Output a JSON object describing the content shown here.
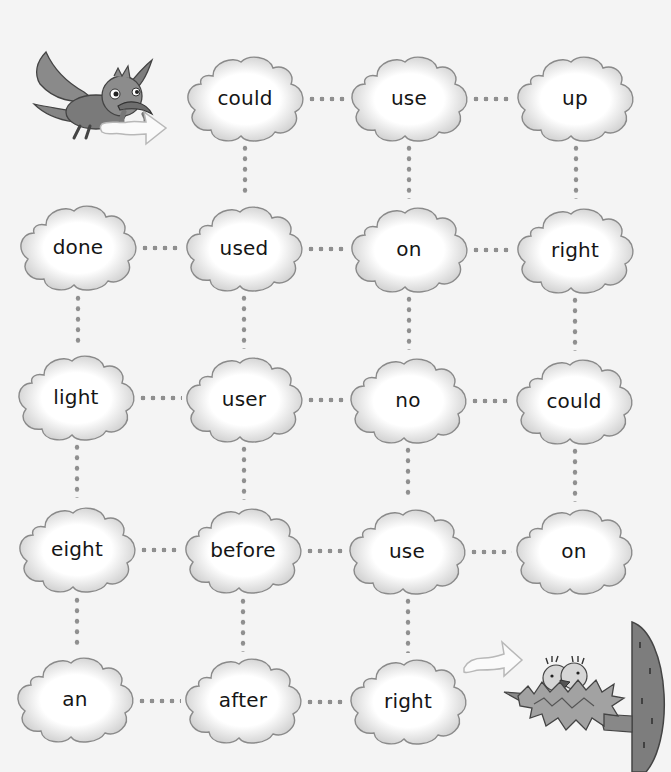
{
  "puzzle": {
    "type": "word-maze",
    "start_label": "bird-with-worm",
    "end_label": "nest-with-chicks",
    "grid": [
      [
        "",
        "could",
        "use",
        "up"
      ],
      [
        "done",
        "used",
        "on",
        "right"
      ],
      [
        "light",
        "user",
        "no",
        "could"
      ],
      [
        "eight",
        "before",
        "use",
        "on"
      ],
      [
        "an",
        "after",
        "right",
        ""
      ]
    ],
    "clouds": [
      {
        "id": "r0c1",
        "word": "could",
        "x": 245,
        "y": 98
      },
      {
        "id": "r0c2",
        "word": "use",
        "x": 409,
        "y": 98
      },
      {
        "id": "r0c3",
        "word": "up",
        "x": 575,
        "y": 98
      },
      {
        "id": "r1c0",
        "word": "done",
        "x": 78,
        "y": 247
      },
      {
        "id": "r1c1",
        "word": "used",
        "x": 244,
        "y": 248
      },
      {
        "id": "r1c2",
        "word": "on",
        "x": 409,
        "y": 249
      },
      {
        "id": "r1c3",
        "word": "right",
        "x": 575,
        "y": 250
      },
      {
        "id": "r2c0",
        "word": "light",
        "x": 76,
        "y": 397
      },
      {
        "id": "r2c1",
        "word": "user",
        "x": 244,
        "y": 399
      },
      {
        "id": "r2c2",
        "word": "no",
        "x": 408,
        "y": 400
      },
      {
        "id": "r2c3",
        "word": "could",
        "x": 574,
        "y": 401
      },
      {
        "id": "r3c0",
        "word": "eight",
        "x": 77,
        "y": 549
      },
      {
        "id": "r3c1",
        "word": "before",
        "x": 243,
        "y": 550
      },
      {
        "id": "r3c2",
        "word": "use",
        "x": 407,
        "y": 551
      },
      {
        "id": "r3c3",
        "word": "on",
        "x": 574,
        "y": 551
      },
      {
        "id": "r4c0",
        "word": "an",
        "x": 75,
        "y": 699
      },
      {
        "id": "r4c1",
        "word": "after",
        "x": 243,
        "y": 700
      },
      {
        "id": "r4c2",
        "word": "right",
        "x": 408,
        "y": 701
      }
    ],
    "h_links": [
      {
        "x1": 307,
        "x2": 347,
        "y": 99
      },
      {
        "x1": 471,
        "x2": 513,
        "y": 99
      },
      {
        "x1": 140,
        "x2": 182,
        "y": 248
      },
      {
        "x1": 306,
        "x2": 347,
        "y": 249
      },
      {
        "x1": 471,
        "x2": 513,
        "y": 250
      },
      {
        "x1": 138,
        "x2": 182,
        "y": 398
      },
      {
        "x1": 306,
        "x2": 346,
        "y": 400
      },
      {
        "x1": 470,
        "x2": 512,
        "y": 401
      },
      {
        "x1": 139,
        "x2": 181,
        "y": 550
      },
      {
        "x1": 305,
        "x2": 345,
        "y": 551
      },
      {
        "x1": 469,
        "x2": 512,
        "y": 552
      },
      {
        "x1": 137,
        "x2": 181,
        "y": 701
      },
      {
        "x1": 305,
        "x2": 346,
        "y": 702
      }
    ],
    "v_links": [
      {
        "x": 245,
        "y1": 143,
        "y2": 198
      },
      {
        "x": 409,
        "y1": 143,
        "y2": 199
      },
      {
        "x": 576,
        "y1": 143,
        "y2": 199
      },
      {
        "x": 78,
        "y1": 293,
        "y2": 347
      },
      {
        "x": 244,
        "y1": 293,
        "y2": 349
      },
      {
        "x": 409,
        "y1": 294,
        "y2": 350
      },
      {
        "x": 575,
        "y1": 295,
        "y2": 351
      },
      {
        "x": 77,
        "y1": 442,
        "y2": 498
      },
      {
        "x": 244,
        "y1": 444,
        "y2": 500
      },
      {
        "x": 408,
        "y1": 445,
        "y2": 500
      },
      {
        "x": 575,
        "y1": 446,
        "y2": 502
      },
      {
        "x": 77,
        "y1": 595,
        "y2": 650
      },
      {
        "x": 243,
        "y1": 596,
        "y2": 652
      },
      {
        "x": 408,
        "y1": 596,
        "y2": 653
      }
    ]
  },
  "colors": {
    "background": "#f4f4f4",
    "cloud_fill": "#ffffff",
    "cloud_shade": "#c9c9c9",
    "cloud_stroke": "#8a8a8a",
    "dot": "#8f8f8f",
    "text": "#151515",
    "bird": "#7a7a7a",
    "nest": "#9a9a9a",
    "tree": "#7d7d7d"
  }
}
